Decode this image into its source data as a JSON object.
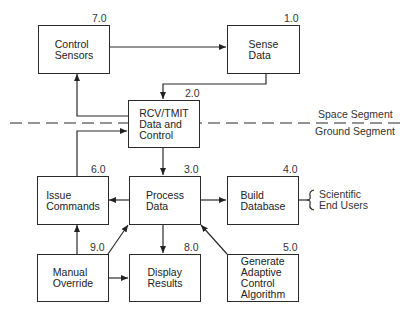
{
  "diagram": {
    "nodes": [
      {
        "id": "7.0",
        "number": "7.0",
        "label": "Control\nSensors"
      },
      {
        "id": "1.0",
        "number": "1.0",
        "label": "Sense\nData"
      },
      {
        "id": "2.0",
        "number": "2.0",
        "label": "RCV/TMIT\nData and\nControl"
      },
      {
        "id": "6.0",
        "number": "6.0",
        "label": "Issue\nCommands"
      },
      {
        "id": "3.0",
        "number": "3.0",
        "label": "Process\nData"
      },
      {
        "id": "4.0",
        "number": "4.0",
        "label": "Build\nDatabase"
      },
      {
        "id": "9.0",
        "number": "9.0",
        "label": "Manual\nOverride"
      },
      {
        "id": "8.0",
        "number": "8.0",
        "label": "Display\nResults"
      },
      {
        "id": "5.0",
        "number": "5.0",
        "label": "Generate\nAdaptive\nControl\nAlgorithm"
      }
    ],
    "edges": [
      {
        "from": "7.0",
        "to": "1.0"
      },
      {
        "from": "1.0",
        "to": "2.0"
      },
      {
        "from": "2.0",
        "to": "7.0"
      },
      {
        "from": "6.0",
        "to": "2.0"
      },
      {
        "from": "2.0",
        "to": "3.0"
      },
      {
        "from": "3.0",
        "to": "6.0"
      },
      {
        "from": "3.0",
        "to": "4.0"
      },
      {
        "from": "3.0",
        "to": "8.0"
      },
      {
        "from": "9.0",
        "to": "6.0"
      },
      {
        "from": "9.0",
        "to": "3.0"
      },
      {
        "from": "9.0",
        "to": "8.0"
      },
      {
        "from": "5.0",
        "to": "3.0"
      },
      {
        "from": "4.0",
        "to": "Scientific End Users"
      }
    ],
    "segment_labels": {
      "space": "Space Segment",
      "ground": "Ground Segment"
    },
    "external": "Scientific\nEnd Users"
  }
}
